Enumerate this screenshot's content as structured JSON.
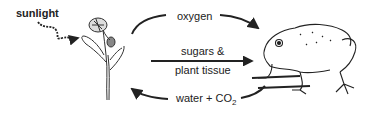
{
  "diagram": {
    "labels": {
      "sunlight": "sunlight",
      "oxygen": "oxygen",
      "sugars_line1": "sugars &",
      "sugars_line2": "plant tissue",
      "water": "water + CO",
      "water_sub": "2"
    },
    "nodes": [
      {
        "id": "plant",
        "icon": "plant-icon"
      },
      {
        "id": "toad",
        "icon": "toad-icon"
      }
    ],
    "edges": [
      {
        "from": "sunlight",
        "to": "plant",
        "label": "sunlight",
        "style": "wavy"
      },
      {
        "from": "plant",
        "to": "toad",
        "label": "oxygen",
        "style": "curved-top"
      },
      {
        "from": "plant",
        "to": "toad",
        "label": "sugars & plant tissue",
        "style": "straight"
      },
      {
        "from": "toad",
        "to": "plant",
        "label": "water + CO2",
        "style": "curved-bottom"
      }
    ],
    "colors": {
      "ink": "#222222",
      "background": "#ffffff"
    }
  }
}
